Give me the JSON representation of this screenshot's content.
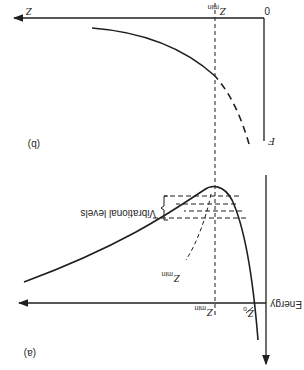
{
  "rotation_deg": 180,
  "colors": {
    "ink": "#1f1f1f",
    "background": "#ffffff"
  },
  "panel_a": {
    "label": "(a)",
    "y_axis_label": "Energy",
    "x_axis_label": "",
    "z_min_axis_label": "Z",
    "z_min_axis_sub": "min",
    "z0_label": "Z",
    "z0_sub": "o",
    "zmin_curve_label": "Z",
    "zmin_curve_sub": "min",
    "vibrational_levels_label": "Vibrational levels",
    "vibrational_level_count": 4
  },
  "panel_b": {
    "label": "(b)",
    "y_axis_label": "F",
    "origin_label": "0",
    "x_axis_label": "Z",
    "z_min_label": "Z",
    "z_min_sub": "min"
  }
}
